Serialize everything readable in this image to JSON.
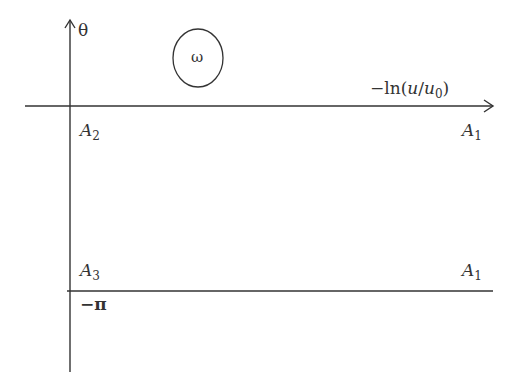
{
  "diagram": {
    "axes": {
      "vertical_label": "θ",
      "horizontal_label_prefix": "−ln(",
      "horizontal_label_u": "u",
      "horizontal_label_slash": "/",
      "horizontal_label_u0": "u",
      "horizontal_label_u0_sub": "0",
      "horizontal_label_suffix": ")",
      "lower_line_label": "−π"
    },
    "region_label": "ω",
    "points": [
      {
        "name": "A",
        "sub": "2"
      },
      {
        "name": "A",
        "sub": "1"
      },
      {
        "name": "A",
        "sub": "3"
      },
      {
        "name": "A",
        "sub": "1"
      }
    ],
    "colors": {
      "line": "#333333",
      "text": "#333333"
    }
  }
}
